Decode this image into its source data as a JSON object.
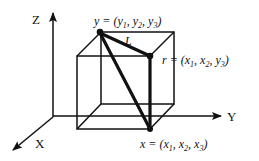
{
  "diagram": {
    "axes": {
      "z_label": "Z",
      "y_label": "Y",
      "x_label": "X"
    },
    "points": {
      "y_point": {
        "name": "y",
        "eq": " = (",
        "c1": "y",
        "s1": "1",
        "c2": "y",
        "s2": "2",
        "c3": "y",
        "s3": "3",
        "close": ")"
      },
      "r_point": {
        "name": "r",
        "eq": " = (",
        "c1": "x",
        "s1": "1",
        "c2": "x",
        "s2": "2",
        "c3": "y",
        "s3": "3",
        "close": ")"
      },
      "x_point": {
        "name": "x",
        "eq": " = (",
        "c1": "x",
        "s1": "1",
        "c2": "x",
        "s2": "2",
        "c3": "x",
        "s3": "3",
        "close": ")"
      }
    },
    "segment_label": "L",
    "colors": {
      "line": "#111111",
      "background": "#ffffff"
    }
  }
}
